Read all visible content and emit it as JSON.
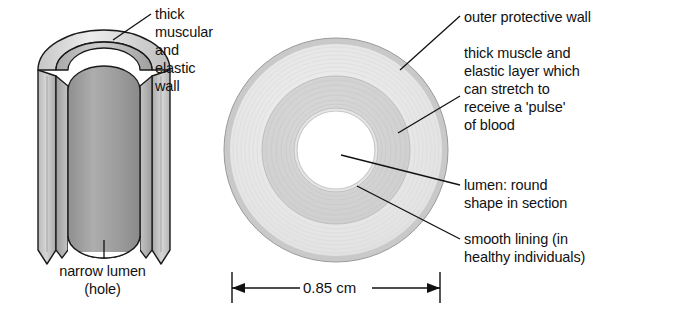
{
  "figure": {
    "title_visible": false,
    "background_color": "#ffffff",
    "ink_color": "#111111",
    "palette": {
      "outer_wall_gray": "#c9c9c9",
      "outer_wall_light": "#e8e8e8",
      "middle_layer_gray": "#d2d2d2",
      "inner_band_light": "#f2f2f2",
      "lumen_white": "#ffffff",
      "tube_body_gray": "#b5b5b5",
      "tube_body_dark": "#9a9a9a",
      "tube_outer_light": "#dcdcdc",
      "outline": "#1a1a1a"
    }
  },
  "left_diagram": {
    "name": "artery-cutaway-3d",
    "labels": [
      {
        "id": "thick-muscular-wall",
        "lines": [
          "thick",
          "muscular",
          "and",
          "elastic",
          "wall"
        ],
        "x": 155,
        "y": 6
      },
      {
        "id": "narrow-lumen",
        "lines": [
          "narrow lumen",
          "(hole)"
        ],
        "x": 97,
        "y": 264
      }
    ]
  },
  "right_diagram": {
    "name": "artery-cross-section",
    "labels": [
      {
        "id": "outer-protective-wall",
        "lines": [
          "outer protective wall"
        ],
        "x": 464,
        "y": 8
      },
      {
        "id": "thick-muscle-elastic-layer",
        "lines": [
          "thick muscle and",
          "elastic layer which",
          "can stretch to",
          "receive a 'pulse'",
          "of blood"
        ],
        "x": 464,
        "y": 44
      },
      {
        "id": "lumen-round-shape",
        "lines": [
          "lumen: round",
          "shape in section"
        ],
        "x": 464,
        "y": 176
      },
      {
        "id": "smooth-lining",
        "lines": [
          "smooth lining (in",
          "healthy individuals)"
        ],
        "x": 464,
        "y": 230
      }
    ],
    "dimension": {
      "id": "diameter-dimension",
      "value": "0.85",
      "unit": "cm",
      "label": "0.85 cm"
    }
  }
}
